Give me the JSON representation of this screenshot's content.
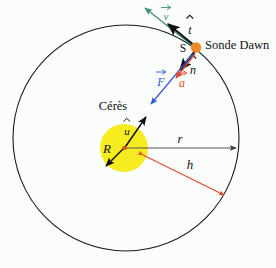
{
  "figure": {
    "title_semantic": "orbital-diagram-dawn-ceres",
    "background_color": "#fbfdfd"
  },
  "bodies": {
    "central_body": {
      "name": "Cérès",
      "color": "#f7ec1f",
      "center": [
        124,
        148
      ],
      "radius": 24
    },
    "spacecraft": {
      "name": "Sonde Dawn",
      "color": "#f08a28",
      "position": [
        196,
        48
      ],
      "point_label": "S"
    }
  },
  "orbit": {
    "center": [
      126,
      138
    ],
    "radius": 113,
    "color": "#1a1a1a"
  },
  "vectors": [
    {
      "symbol": "v",
      "label": "v⃗",
      "color": "#3f8f7a",
      "description": "velocity-vector",
      "tangential": true
    },
    {
      "symbol": "t",
      "label": "t̂",
      "color": "#111111",
      "description": "tangential-unit-vector"
    },
    {
      "symbol": "n",
      "label": "n̂",
      "color": "#111111",
      "description": "normal-unit-vector"
    },
    {
      "symbol": "F",
      "label": "F⃗",
      "color": "#2b56d8",
      "description": "gravitational-force-vector"
    },
    {
      "symbol": "a",
      "label": "a⃗",
      "color": "#e8442a",
      "description": "acceleration-vector"
    },
    {
      "symbol": "u",
      "label": "û",
      "color": "#111111",
      "description": "radial-unit-vector"
    }
  ],
  "distances": [
    {
      "symbol": "R",
      "label": "R",
      "color": "#111111",
      "description": "ceres-radius"
    },
    {
      "symbol": "r",
      "label": "r",
      "color": "#555555",
      "description": "orbital-radius"
    },
    {
      "symbol": "h",
      "label": "h",
      "color": "#e8442a",
      "description": "altitude-above-surface"
    }
  ],
  "labels": {
    "ceres": "Cérès",
    "sonde_dawn": "Sonde Dawn",
    "s_point": "S",
    "v_vector": "v",
    "t_vector": "t",
    "n_vector": "n",
    "f_vector": "F",
    "a_vector": "a",
    "u_vector": "u",
    "r_radius": "R",
    "r_orbit": "r",
    "h_altitude": "h"
  }
}
